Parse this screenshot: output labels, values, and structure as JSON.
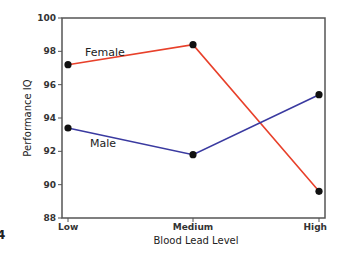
{
  "chart_data": {
    "type": "line",
    "title": "",
    "xlabel": "Blood Lead Level",
    "ylabel": "Performance IQ",
    "categories": [
      "Low",
      "Medium",
      "High"
    ],
    "ylim": [
      88,
      100
    ],
    "yticks": [
      88,
      90,
      92,
      94,
      96,
      98,
      100
    ],
    "grid": false,
    "legend": "inline labels",
    "series": [
      {
        "name": "Female",
        "color": "#e8402a",
        "values": [
          97.2,
          98.4,
          89.6
        ]
      },
      {
        "name": "Male",
        "color": "#3a3aa0",
        "values": [
          93.4,
          91.8,
          95.4
        ]
      }
    ]
  },
  "artifact_text": "4"
}
